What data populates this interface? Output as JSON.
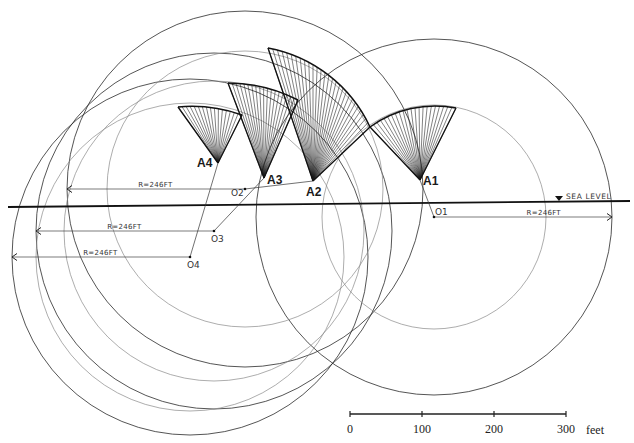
{
  "diagram": {
    "sea_level_label": "SEA LEVEL",
    "radius_label": "R=246FT",
    "colors": {
      "ink": "#1a1a1a",
      "light_ink": "#8a8a8a",
      "background": "#ffffff"
    },
    "sea_level_line": {
      "x1": 8,
      "y1": 207,
      "x2": 630,
      "y2": 201
    },
    "sea_level_marker": {
      "x": 559,
      "y": 199
    },
    "centers": [
      {
        "id": "O1",
        "label": "O1",
        "x": 434,
        "y": 217,
        "radius_px": 178,
        "inner_radius_px": 112,
        "radius_arrow_dir": "right",
        "radius_label": "R=246FT"
      },
      {
        "id": "O2",
        "label": "O2",
        "x": 245,
        "y": 189,
        "radius_px": 178,
        "inner_radius_px": 138,
        "radius_arrow_dir": "left",
        "radius_label": "R=246FT"
      },
      {
        "id": "O3",
        "label": "O3",
        "x": 214,
        "y": 231,
        "radius_px": 178,
        "inner_radius_px": 150,
        "radius_arrow_dir": "left",
        "radius_label": "R=246FT"
      },
      {
        "id": "O4",
        "label": "O4",
        "x": 190,
        "y": 257,
        "radius_px": 178,
        "inner_radius_px": 154,
        "radius_arrow_dir": "left",
        "radius_label": "R=246FT"
      }
    ],
    "shells": [
      {
        "id": "A1",
        "label": "A1",
        "apex": [
          420,
          180
        ],
        "left": [
          370,
          127
        ],
        "right": [
          456,
          108
        ],
        "center": "O1",
        "ribs": 22
      },
      {
        "id": "A2",
        "label": "A2",
        "apex": [
          313,
          181
        ],
        "left": [
          268,
          48
        ],
        "right": [
          370,
          127
        ],
        "center": "O2",
        "ribs": 28
      },
      {
        "id": "A3",
        "label": "A3",
        "apex": [
          264,
          178
        ],
        "left": [
          228,
          83
        ],
        "right": [
          298,
          100
        ],
        "center": "O3",
        "ribs": 18
      },
      {
        "id": "A4",
        "label": "A4",
        "apex": [
          218,
          163
        ],
        "left": [
          178,
          107
        ],
        "right": [
          242,
          115
        ],
        "center": "O4",
        "ribs": 16
      }
    ]
  },
  "scale_bar": {
    "unit": "feet",
    "x_start": 350,
    "x_end": 566,
    "y": 414,
    "ticks": [
      {
        "value": "0",
        "x": 350
      },
      {
        "value": "100",
        "x": 422
      },
      {
        "value": "200",
        "x": 494
      },
      {
        "value": "300",
        "x": 566
      }
    ]
  }
}
